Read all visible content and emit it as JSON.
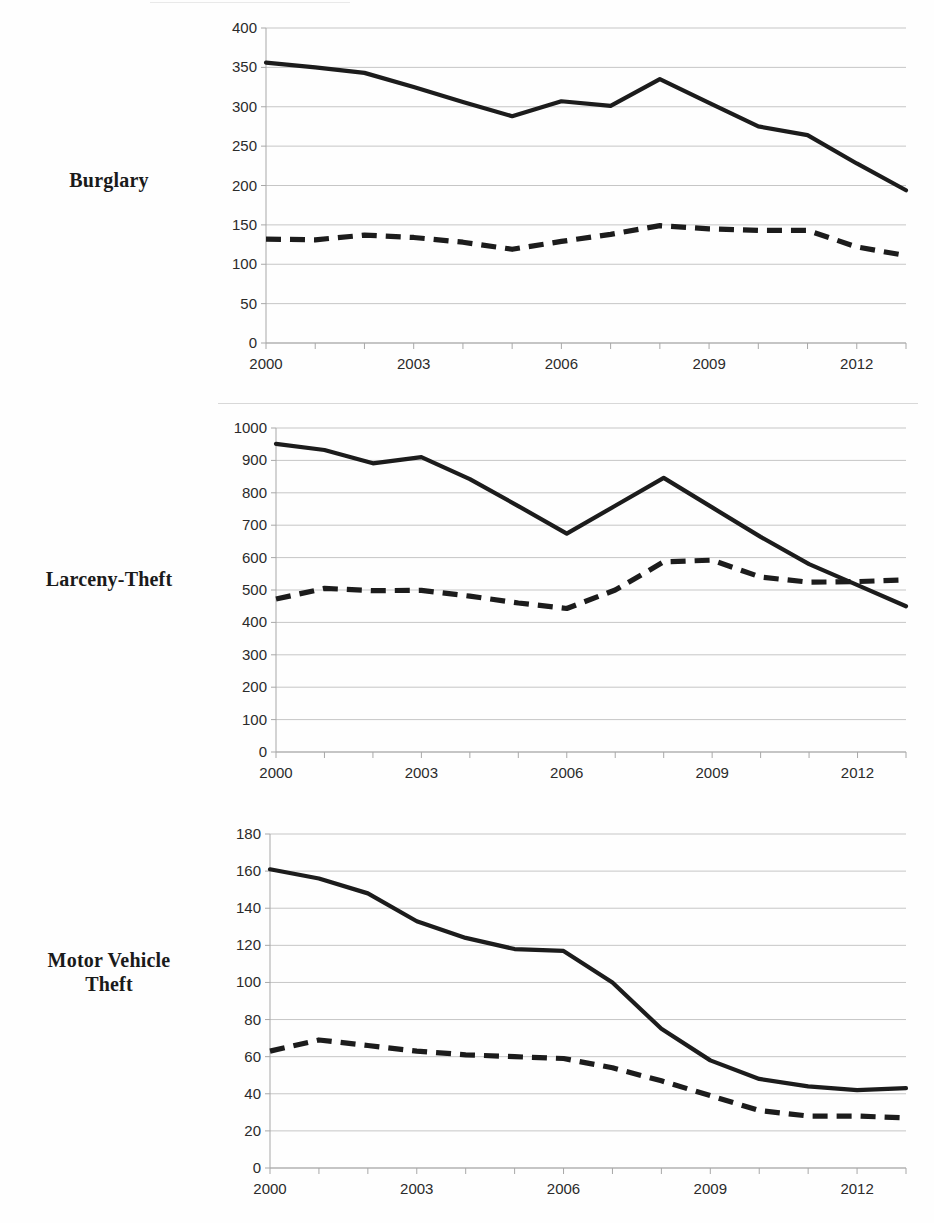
{
  "figure": {
    "background_color": "#fefefe",
    "line_color": "#1c1c1c",
    "grid_color": "#c6c6c6",
    "axis_color": "#a8a8a8"
  },
  "panels": [
    {
      "id": "burglary",
      "label": "Burglary",
      "label_lines": [
        "Burglary"
      ]
    },
    {
      "id": "larceny-theft",
      "label": "Larceny-Theft",
      "label_lines": [
        "Larceny-Theft"
      ]
    },
    {
      "id": "motor-vehicle-theft",
      "label": "Motor Vehicle Theft",
      "label_lines": [
        "Motor Vehicle",
        "Theft"
      ]
    }
  ],
  "chart_data": [
    {
      "type": "line",
      "title": "Burglary",
      "xlabel": "",
      "ylabel": "",
      "x": [
        2000,
        2001,
        2002,
        2003,
        2004,
        2005,
        2006,
        2007,
        2008,
        2009,
        2010,
        2011,
        2012,
        2013
      ],
      "xtick_labels": [
        "2000",
        "2003",
        "2006",
        "2009",
        "2012"
      ],
      "xticks": [
        2000,
        2003,
        2006,
        2009,
        2012
      ],
      "xlim": [
        2000,
        2013
      ],
      "ylim": [
        0,
        400
      ],
      "yticks": [
        0,
        50,
        100,
        150,
        200,
        250,
        300,
        350,
        400
      ],
      "ytick_labels": [
        "0",
        "50",
        "100",
        "150",
        "200",
        "250",
        "300",
        "350",
        "400"
      ],
      "grid": true,
      "legend": "none",
      "series": [
        {
          "name": "solid",
          "style": "solid",
          "values": [
            356,
            350,
            343,
            325,
            306,
            288,
            307,
            301,
            335,
            305,
            275,
            264,
            228,
            194
          ]
        },
        {
          "name": "dashed",
          "style": "dashed",
          "values": [
            132,
            131,
            137,
            134,
            128,
            119,
            129,
            138,
            149,
            145,
            143,
            143,
            122,
            111
          ]
        }
      ]
    },
    {
      "type": "line",
      "title": "Larceny-Theft",
      "xlabel": "",
      "ylabel": "",
      "x": [
        2000,
        2001,
        2002,
        2003,
        2004,
        2005,
        2006,
        2007,
        2008,
        2009,
        2010,
        2011,
        2012,
        2013
      ],
      "xtick_labels": [
        "2000",
        "2003",
        "2006",
        "2009",
        "2012"
      ],
      "xticks": [
        2000,
        2003,
        2006,
        2009,
        2012
      ],
      "xlim": [
        2000,
        2013
      ],
      "ylim": [
        0,
        1000
      ],
      "yticks": [
        0,
        100,
        200,
        300,
        400,
        500,
        600,
        700,
        800,
        900,
        1000
      ],
      "ytick_labels": [
        "0",
        "100",
        "200",
        "300",
        "400",
        "500",
        "600",
        "700",
        "800",
        "900",
        "1000"
      ],
      "grid": true,
      "legend": "none",
      "series": [
        {
          "name": "solid",
          "style": "solid",
          "values": [
            951,
            932,
            891,
            910,
            842,
            759,
            674,
            760,
            846,
            755,
            664,
            580,
            515,
            450
          ]
        },
        {
          "name": "dashed",
          "style": "dashed",
          "values": [
            472,
            505,
            498,
            499,
            481,
            460,
            443,
            500,
            587,
            592,
            540,
            524,
            526,
            531
          ]
        }
      ]
    },
    {
      "type": "line",
      "title": "Motor Vehicle Theft",
      "xlabel": "",
      "ylabel": "",
      "x": [
        2000,
        2001,
        2002,
        2003,
        2004,
        2005,
        2006,
        2007,
        2008,
        2009,
        2010,
        2011,
        2012,
        2013
      ],
      "xtick_labels": [
        "2000",
        "2003",
        "2006",
        "2009",
        "2012"
      ],
      "xticks": [
        2000,
        2003,
        2006,
        2009,
        2012
      ],
      "xlim": [
        2000,
        2013
      ],
      "ylim": [
        0,
        180
      ],
      "yticks": [
        0,
        20,
        40,
        60,
        80,
        100,
        120,
        140,
        160,
        180
      ],
      "ytick_labels": [
        "0",
        "20",
        "40",
        "60",
        "80",
        "100",
        "120",
        "140",
        "160",
        "180"
      ],
      "grid": true,
      "legend": "none",
      "series": [
        {
          "name": "solid",
          "style": "solid",
          "values": [
            161,
            156,
            148,
            133,
            124,
            118,
            117,
            100,
            75,
            58,
            48,
            44,
            42,
            43
          ]
        },
        {
          "name": "dashed",
          "style": "dashed",
          "values": [
            63,
            69,
            66,
            63,
            61,
            60,
            59,
            54,
            47,
            39,
            31,
            28,
            28,
            27
          ]
        }
      ]
    }
  ]
}
